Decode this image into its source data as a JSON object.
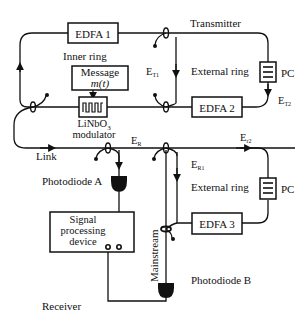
{
  "diagram": {
    "type": "optical-fiber-chaos-communication-setup",
    "colors": {
      "line": "#111111",
      "background": "#ffffff"
    },
    "sections": {
      "transmitter": "Transmitter",
      "receiver": "Receiver",
      "link": "Link",
      "inner_ring": "Inner ring",
      "external_ring_top": "External ring",
      "external_ring_bottom": "External ring",
      "mainstream": "Mainstream"
    },
    "components": {
      "edfa1": "EDFA 1",
      "edfa2": "EDFA 2",
      "edfa3": "EDFA 3",
      "message_line1": "Message",
      "message_line2": "m(t)",
      "modulator_line1": "LiNbO",
      "modulator_sub": "3",
      "modulator_line2": "modulator",
      "pc_top": "PC",
      "pc_bottom": "PC",
      "photodiode_a": "Photodiode A",
      "photodiode_b": "Photodiode B",
      "spd_line1": "Signal",
      "spd_line2": "processing",
      "spd_line3": "device"
    },
    "signals": {
      "et1_main": "E",
      "et1_sub": "T1",
      "et2_main": "E",
      "et2_sub": "T2",
      "er_main": "E",
      "er_sub": "R",
      "er1_main": "E",
      "er1_sub": "R1",
      "er2_main": "E",
      "er2_sub": "r2"
    }
  }
}
